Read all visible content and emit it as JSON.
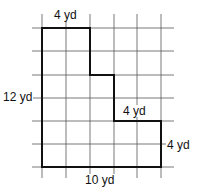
{
  "diagram": {
    "type": "rectilinear-polygon-on-grid",
    "grid": {
      "x_lines": [
        42,
        66,
        90,
        114,
        137,
        161
      ],
      "y_lines": [
        28,
        51,
        75,
        98,
        121,
        144,
        167
      ],
      "x_extent": [
        32,
        174
      ],
      "y_extent": [
        14,
        178
      ],
      "color": "#555555"
    },
    "shape": {
      "points": "42,28 90,28 90,75 114,75 114,121 161,121 161,167 42,167",
      "stroke": "#111111"
    },
    "labels": {
      "top": "4 yd",
      "left": "12 yd",
      "step": "4 yd",
      "right": "4 yd",
      "bottom": "10 yd"
    }
  }
}
